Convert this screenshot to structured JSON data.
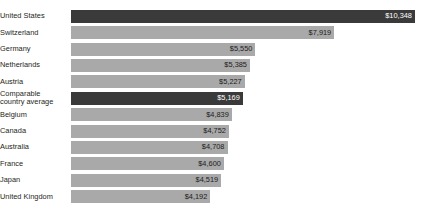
{
  "chart_data": {
    "type": "bar",
    "orientation": "horizontal",
    "title": "",
    "subtitle": "",
    "xlabel": "",
    "ylabel": "",
    "grid": false,
    "legend": null,
    "xlim": [
      0,
      10348
    ],
    "value_prefix": "$",
    "categories": [
      "United States",
      "Switzerland",
      "Germany",
      "Netherlands",
      "Austria",
      "Comparable\ncountry average",
      "Belgium",
      "Canada",
      "Australia",
      "France",
      "Japan",
      "United Kingdom"
    ],
    "values": [
      10348,
      7919,
      5550,
      5385,
      5227,
      5169,
      4839,
      4752,
      4708,
      4600,
      4519,
      4192
    ],
    "value_labels": [
      "$10,348",
      "$7,919",
      "$5,550",
      "$5,385",
      "$5,227",
      "$5,169",
      "$4,839",
      "$4,752",
      "$4,708",
      "$4,600",
      "$4,519",
      "$4,192"
    ],
    "highlighted": [
      true,
      false,
      false,
      false,
      false,
      true,
      false,
      false,
      false,
      false,
      false,
      false
    ],
    "colors": {
      "bar": "#a9a9a9",
      "bar_highlight": "#3a3a3a",
      "label_text": "#231f20",
      "value_text": "#1b1b1b",
      "value_text_highlight": "#ffffff",
      "background": "#ffffff"
    }
  }
}
